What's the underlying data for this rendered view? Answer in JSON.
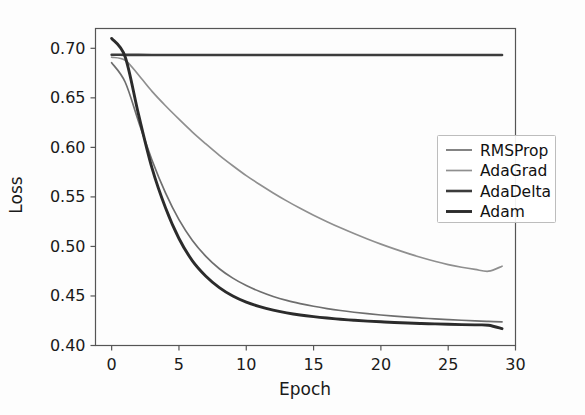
{
  "chart_data": {
    "type": "line",
    "title": "",
    "xlabel": "Epoch",
    "ylabel": "Loss",
    "xlim": [
      -1.2,
      30
    ],
    "ylim": [
      0.4,
      0.72
    ],
    "xticks": [
      0,
      5,
      10,
      15,
      20,
      25,
      30
    ],
    "xtick_labels": [
      "0",
      "5",
      "10",
      "15",
      "20",
      "25",
      "30"
    ],
    "yticks": [
      0.4,
      0.45,
      0.5,
      0.55,
      0.6,
      0.65,
      0.7
    ],
    "ytick_labels": [
      "0.40",
      "0.45",
      "0.50",
      "0.55",
      "0.60",
      "0.65",
      "0.70"
    ],
    "grid": false,
    "legend_position": "center right",
    "x": [
      0,
      1,
      2,
      3,
      4,
      5,
      6,
      7,
      8,
      9,
      10,
      11,
      12,
      13,
      14,
      15,
      16,
      17,
      18,
      19,
      20,
      21,
      22,
      23,
      24,
      25,
      26,
      27,
      28,
      29
    ],
    "series": [
      {
        "name": "RMSProp",
        "color": "#6e6e6e",
        "width": 1.7,
        "values": [
          0.6855,
          0.666,
          0.626,
          0.587,
          0.554,
          0.527,
          0.506,
          0.49,
          0.4775,
          0.468,
          0.4605,
          0.4545,
          0.4495,
          0.4455,
          0.4423,
          0.4396,
          0.4373,
          0.4353,
          0.4336,
          0.4321,
          0.4308,
          0.4296,
          0.4286,
          0.4277,
          0.4269,
          0.4262,
          0.4255,
          0.4249,
          0.4243,
          0.4238
        ]
      },
      {
        "name": "AdaGrad",
        "color": "#8f8f8f",
        "width": 1.7,
        "values": [
          0.691,
          0.688,
          0.673,
          0.6565,
          0.642,
          0.6285,
          0.6155,
          0.6035,
          0.592,
          0.5815,
          0.5715,
          0.5625,
          0.554,
          0.546,
          0.5385,
          0.5315,
          0.525,
          0.5188,
          0.513,
          0.5075,
          0.5023,
          0.4975,
          0.493,
          0.4888,
          0.485,
          0.4817,
          0.479,
          0.4768,
          0.475,
          0.48
        ]
      },
      {
        "name": "AdaDelta",
        "color": "#3c3c3c",
        "width": 2.6,
        "values": [
          0.6935,
          0.6934,
          0.6934,
          0.6933,
          0.6933,
          0.6933,
          0.6933,
          0.6933,
          0.6932,
          0.6932,
          0.6932,
          0.6932,
          0.6932,
          0.6932,
          0.6932,
          0.6932,
          0.6932,
          0.6932,
          0.6932,
          0.6932,
          0.6932,
          0.6932,
          0.6932,
          0.6932,
          0.6932,
          0.6932,
          0.6932,
          0.6932,
          0.6932,
          0.6932
        ]
      },
      {
        "name": "Adam",
        "color": "#2b2b2b",
        "width": 2.9,
        "values": [
          0.71,
          0.6915,
          0.633,
          0.579,
          0.539,
          0.508,
          0.4855,
          0.47,
          0.4585,
          0.45,
          0.4438,
          0.4392,
          0.4357,
          0.433,
          0.4308,
          0.4291,
          0.4277,
          0.4265,
          0.4255,
          0.4246,
          0.4239,
          0.4232,
          0.4227,
          0.4222,
          0.4218,
          0.4214,
          0.4211,
          0.4208,
          0.4205,
          0.417
        ]
      }
    ]
  },
  "legend": {
    "entries": [
      {
        "label": "RMSProp"
      },
      {
        "label": "AdaGrad"
      },
      {
        "label": "AdaDelta"
      },
      {
        "label": "Adam"
      }
    ]
  }
}
